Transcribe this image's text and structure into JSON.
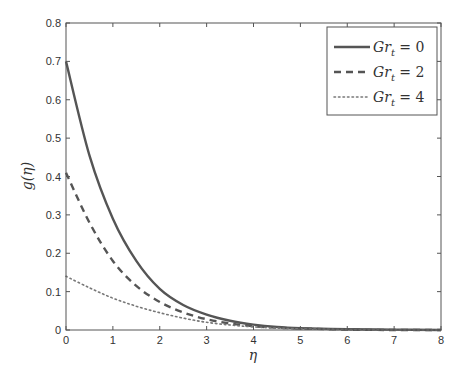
{
  "chart_data": {
    "type": "line",
    "title": "",
    "xlabel": "η",
    "ylabel": "g(η)",
    "xlim": [
      0,
      8
    ],
    "ylim": [
      0,
      0.8
    ],
    "xticks": [
      0,
      1,
      2,
      3,
      4,
      5,
      6,
      7,
      8
    ],
    "yticks": [
      0,
      0.1,
      0.2,
      0.3,
      0.4,
      0.5,
      0.6,
      0.7,
      0.8
    ],
    "xtick_labels": [
      "0",
      "1",
      "2",
      "3",
      "4",
      "5",
      "6",
      "7",
      "8"
    ],
    "ytick_labels": [
      "0",
      "0.1",
      "0.2",
      "0.3",
      "0.4",
      "0.5",
      "0.6",
      "0.7",
      "0.8"
    ],
    "grid": false,
    "legend_position": "upper right",
    "x": [
      0,
      0.5,
      1,
      1.5,
      2,
      2.5,
      3,
      3.5,
      4,
      4.5,
      5,
      6,
      7,
      8
    ],
    "series": [
      {
        "name": "Gr_t = 0",
        "label_main": "Gr",
        "label_sub": "t",
        "label_value": "= 0",
        "style": "solid",
        "color": "#555555",
        "values": [
          0.7,
          0.455,
          0.29,
          0.18,
          0.107,
          0.065,
          0.04,
          0.024,
          0.014,
          0.008,
          0.005,
          0.002,
          0.001,
          0.0
        ]
      },
      {
        "name": "Gr_t = 2",
        "label_main": "Gr",
        "label_sub": "t",
        "label_value": "= 2",
        "style": "dashed",
        "color": "#555555",
        "values": [
          0.41,
          0.28,
          0.18,
          0.115,
          0.073,
          0.046,
          0.028,
          0.017,
          0.01,
          0.006,
          0.004,
          0.001,
          0.0,
          0.0
        ]
      },
      {
        "name": "Gr_t = 4",
        "label_main": "Gr",
        "label_sub": "t",
        "label_value": "= 4",
        "style": "dotted",
        "color": "#777777",
        "values": [
          0.14,
          0.11,
          0.083,
          0.062,
          0.045,
          0.031,
          0.02,
          0.013,
          0.008,
          0.005,
          0.003,
          0.001,
          0.0,
          0.0
        ]
      }
    ]
  },
  "layout": {
    "plot_left": 66,
    "plot_top": 23,
    "plot_right": 441,
    "plot_bottom": 330
  }
}
